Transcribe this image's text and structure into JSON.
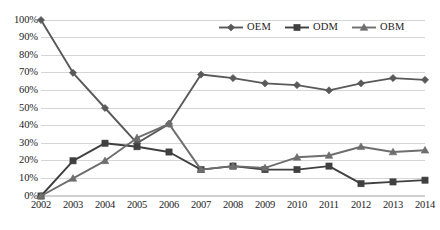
{
  "chart_data": {
    "type": "line",
    "title": "",
    "subtitle": "",
    "xlabel": "",
    "ylabel": "",
    "categories": [
      "2002",
      "2003",
      "2004",
      "2005",
      "2006",
      "2007",
      "2008",
      "2009",
      "2010",
      "2011",
      "2012",
      "2013",
      "2014"
    ],
    "ylim": [
      0,
      100
    ],
    "yticks": [
      "0%",
      "10%",
      "20%",
      "30%",
      "40%",
      "50%",
      "60%",
      "70%",
      "80%",
      "90%",
      "100%"
    ],
    "ytick_values": [
      0,
      10,
      20,
      30,
      40,
      50,
      60,
      70,
      80,
      90,
      100
    ],
    "grid": "horizontal",
    "legend_position": "top-right-inside",
    "series": [
      {
        "name": "OEM",
        "marker": "diamond",
        "color": "#595959",
        "values": [
          100,
          70,
          50,
          30,
          41,
          69,
          67,
          64,
          63,
          60,
          64,
          67,
          66
        ]
      },
      {
        "name": "ODM",
        "marker": "square",
        "color": "#404040",
        "values": [
          0,
          20,
          30,
          28,
          25,
          15,
          17,
          15,
          15,
          17,
          7,
          8,
          9
        ]
      },
      {
        "name": "OBM",
        "marker": "triangle",
        "color": "#6e6e6e",
        "values": [
          0,
          10,
          20,
          33,
          41,
          15,
          17,
          16,
          22,
          23,
          28,
          25,
          26
        ]
      }
    ]
  },
  "legend": {
    "items": [
      {
        "label": "OEM",
        "marker": "diamond-marker-icon"
      },
      {
        "label": "ODM",
        "marker": "square-marker-icon"
      },
      {
        "label": "OBM",
        "marker": "triangle-marker-icon"
      }
    ]
  },
  "colors": {
    "gridline": "#d0d0d0",
    "axis_text": "#1d1d1d",
    "background": "#ffffff",
    "oem": "#595959",
    "odm": "#404040",
    "obm": "#6e6e6e"
  }
}
